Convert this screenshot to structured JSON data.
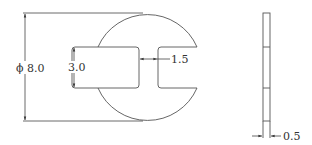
{
  "diagram": {
    "type": "technical-drawing",
    "front_view": {
      "dimensions": {
        "outer_diameter": "ϕ 8.0",
        "slot_height": "3.0",
        "web_width": "1.5"
      }
    },
    "side_view": {
      "dimensions": {
        "thickness": "0.5"
      }
    },
    "colors": {
      "line": "#555555",
      "text": "#333333",
      "background": "#ffffff"
    }
  }
}
